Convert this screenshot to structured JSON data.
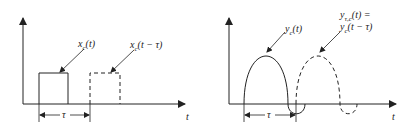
{
  "left_plot": {
    "signal_label": "x_c(t)",
    "signal_label_main": "x",
    "signal_label_sub": "c",
    "signal_label_arg": "(t)",
    "delayed_label": "x_c(t − τ)",
    "delayed_label_main": "x",
    "delayed_label_sub": "c",
    "delayed_label_arg": "(t − τ)",
    "delay_symbol": "τ",
    "axis_label": "t"
  },
  "right_plot": {
    "signal_label": "y_c(t)",
    "signal_label_main": "y",
    "signal_label_sub": "c",
    "signal_label_arg": "(t)",
    "delayed_label_line1": "y_τ,c(t) =",
    "delayed_label_line1_main": "y",
    "delayed_label_line1_sub": "τ,c",
    "delayed_label_line1_arg": "(t) =",
    "delayed_label_line2": "y_c(t − τ)",
    "delayed_label_line2_main": "y",
    "delayed_label_line2_sub": "c",
    "delayed_label_line2_arg": "(t − τ)",
    "delay_symbol": "τ",
    "axis_label": "t"
  },
  "colors": {
    "stroke": "#222222",
    "background": "#ffffff"
  }
}
